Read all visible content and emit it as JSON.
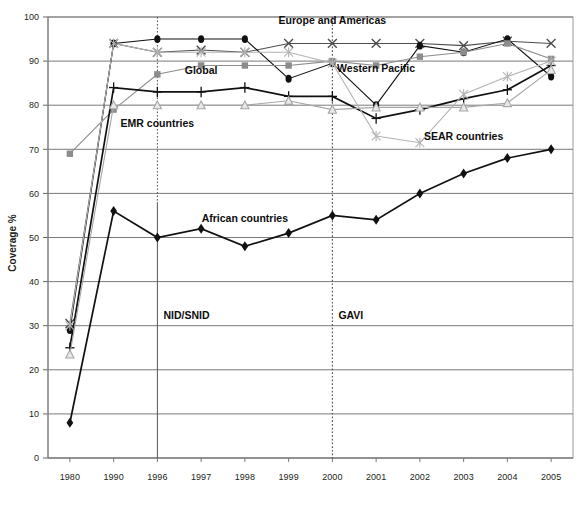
{
  "chart_data": {
    "type": "line",
    "title": "",
    "xlabel": "",
    "ylabel": "Coverage %",
    "ylim": [
      0,
      100
    ],
    "ytick_step": 10,
    "grid": true,
    "legend_position": "inline-annotations",
    "x": [
      "1980",
      "1990",
      "1996",
      "1997",
      "1998",
      "1999",
      "2000",
      "2001",
      "2002",
      "2003",
      "2004",
      "2005"
    ],
    "x_positions_even": true,
    "yticks": [
      "0",
      "10",
      "20",
      "30",
      "40",
      "50",
      "60",
      "70",
      "80",
      "90",
      "100"
    ],
    "series": [
      {
        "name": "Europe and Americas",
        "marker": "x-cross",
        "color": "#4d4d4d",
        "label_shown": true,
        "values": [
          30.5,
          94,
          92,
          92.5,
          92,
          94,
          94,
          94,
          94,
          93.5,
          94.5,
          94
        ]
      },
      {
        "name": "Western Pacific",
        "marker": "filled-circle",
        "color": "#111111",
        "label_shown": true,
        "values": [
          29,
          94,
          95,
          95,
          95,
          86,
          89.5,
          80,
          93.5,
          92,
          95,
          86.5
        ]
      },
      {
        "name": "EMR countries",
        "marker": "filled-square",
        "color": "#8c8c8c",
        "label_shown": true,
        "values": [
          69,
          79,
          87,
          89,
          89,
          89,
          90,
          89,
          91,
          92,
          94,
          90.5
        ]
      },
      {
        "name": "Global",
        "marker": "plus",
        "color": "#111111",
        "label_shown": true,
        "values": [
          25,
          84,
          83,
          83,
          84,
          82,
          82,
          77,
          79,
          81.5,
          83.5,
          89
        ]
      },
      {
        "name": "SEAR countries",
        "marker": "open-triangle",
        "color": "#a6a6a6",
        "label_shown": true,
        "values": [
          23.5,
          80,
          80,
          80,
          80,
          81,
          79,
          79.5,
          79.5,
          79.5,
          80.5,
          88
        ]
      },
      {
        "name": "SEAR light cross",
        "marker": "light-x-cross",
        "color": "#b3b3b3",
        "label_shown": false,
        "values": [
          30,
          94,
          92,
          92,
          92,
          92,
          89.5,
          73,
          71.5,
          82.5,
          86.5,
          90
        ]
      },
      {
        "name": "African countries",
        "marker": "filled-diamond",
        "color": "#111111",
        "label_shown": true,
        "values": [
          8,
          56,
          50,
          52,
          48,
          51,
          55,
          54,
          60,
          64.5,
          68,
          70
        ]
      }
    ],
    "annotations": [
      {
        "name": "europe-and-americas-label",
        "text": "Europe and Americas",
        "x": "2000",
        "y": 98.5
      },
      {
        "name": "western-pacific-label",
        "text": "Western Pacific",
        "x": "2001",
        "y": 87.5
      },
      {
        "name": "global-label",
        "text": "Global",
        "x": "1997",
        "y": 87.0
      },
      {
        "name": "emr-countries-label",
        "text": "EMR countries",
        "x": "1996",
        "y": 75.0
      },
      {
        "name": "sear-countries-label",
        "text": "SEAR countries",
        "x": "2003",
        "y": 72.0
      },
      {
        "name": "african-countries-label",
        "text": "African countries",
        "x": "1998",
        "y": 53.5
      }
    ],
    "event_markers": [
      {
        "name": "nid-snid-event",
        "label": "NID/SNID",
        "x": "1996",
        "style": "dotted-vertical"
      },
      {
        "name": "gavi-event",
        "label": "GAVI",
        "x": "2000",
        "style": "dotted-vertical"
      }
    ],
    "colors": {
      "axis": "#808080",
      "grid": "#7a7a7a",
      "plot_border": "#9a9a9a",
      "background": "#ffffff"
    }
  }
}
